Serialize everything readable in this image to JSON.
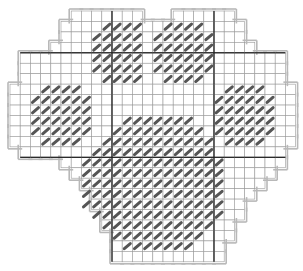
{
  "chart": {
    "type": "cross-stitch-pattern",
    "grid": {
      "cols": 28,
      "rows": 24,
      "origin_x": 10,
      "origin_y": 11,
      "cell_w": 10.2,
      "cell_h": 10.45,
      "major_every": 10,
      "major_cols": [
        10,
        20
      ],
      "major_rows": [
        4,
        14
      ]
    },
    "colors": {
      "fabric": "#ffffff",
      "grid_line": "#9a9a9a",
      "major_line": "#222222",
      "outline": "#b8b8b8",
      "stitch": "#555555"
    },
    "fabric_rows": [
      [
        [
          6,
          13
        ],
        [
          16,
          22
        ]
      ],
      [
        [
          5,
          23
        ]
      ],
      [
        [
          5,
          23
        ]
      ],
      [
        [
          4,
          24
        ]
      ],
      [
        [
          1,
          27
        ]
      ],
      [
        [
          1,
          27
        ]
      ],
      [
        [
          1,
          27
        ]
      ],
      [
        [
          0,
          28
        ]
      ],
      [
        [
          0,
          28
        ]
      ],
      [
        [
          0,
          28
        ]
      ],
      [
        [
          0,
          28
        ]
      ],
      [
        [
          0,
          28
        ]
      ],
      [
        [
          0,
          28
        ]
      ],
      [
        [
          1,
          27
        ]
      ],
      [
        [
          5,
          27
        ]
      ],
      [
        [
          6,
          26
        ]
      ],
      [
        [
          7,
          25
        ]
      ],
      [
        [
          8,
          24
        ]
      ],
      [
        [
          8,
          23
        ]
      ],
      [
        [
          9,
          23
        ]
      ],
      [
        [
          9,
          22
        ]
      ],
      [
        [
          10,
          22
        ]
      ],
      [
        [
          10,
          21
        ]
      ],
      [
        [
          10,
          21
        ]
      ]
    ],
    "stitch_blocks": [
      {
        "name": "toe-top-left",
        "rows": [
          {
            "r": 1,
            "c": [
              9,
              12
            ]
          },
          {
            "r": 2,
            "c": [
              8,
              12
            ]
          },
          {
            "r": 3,
            "c": [
              8,
              12
            ]
          },
          {
            "r": 4,
            "c": [
              8,
              12
            ]
          },
          {
            "r": 5,
            "c": [
              8,
              12
            ]
          },
          {
            "r": 6,
            "c": [
              9,
              12
            ]
          }
        ]
      },
      {
        "name": "toe-top-right",
        "rows": [
          {
            "r": 1,
            "c": [
              15,
              18
            ]
          },
          {
            "r": 2,
            "c": [
              14,
              19
            ]
          },
          {
            "r": 3,
            "c": [
              14,
              19
            ]
          },
          {
            "r": 4,
            "c": [
              14,
              19
            ]
          },
          {
            "r": 5,
            "c": [
              14,
              19
            ]
          },
          {
            "r": 6,
            "c": [
              15,
              18
            ]
          }
        ]
      },
      {
        "name": "toe-left",
        "rows": [
          {
            "r": 7,
            "c": [
              3,
              6
            ]
          },
          {
            "r": 8,
            "c": [
              2,
              7
            ]
          },
          {
            "r": 9,
            "c": [
              2,
              7
            ]
          },
          {
            "r": 10,
            "c": [
              2,
              7
            ]
          },
          {
            "r": 11,
            "c": [
              2,
              7
            ]
          },
          {
            "r": 12,
            "c": [
              3,
              6
            ]
          }
        ]
      },
      {
        "name": "toe-right",
        "rows": [
          {
            "r": 7,
            "c": [
              21,
              24
            ]
          },
          {
            "r": 8,
            "c": [
              20,
              25
            ]
          },
          {
            "r": 9,
            "c": [
              20,
              25
            ]
          },
          {
            "r": 10,
            "c": [
              20,
              25
            ]
          },
          {
            "r": 11,
            "c": [
              20,
              25
            ]
          },
          {
            "r": 12,
            "c": [
              21,
              24
            ]
          }
        ]
      },
      {
        "name": "main-pad",
        "rows": [
          {
            "r": 10,
            "c": [
              11,
              17
            ]
          },
          {
            "r": 11,
            "c": [
              10,
              18
            ]
          },
          {
            "r": 12,
            "c": [
              9,
              19
            ]
          },
          {
            "r": 13,
            "c": [
              8,
              19
            ]
          },
          {
            "r": 14,
            "c": [
              7,
              20
            ]
          },
          {
            "r": 15,
            "c": [
              7,
              20
            ]
          },
          {
            "r": 16,
            "c": [
              7,
              20
            ]
          },
          {
            "r": 17,
            "c": [
              7,
              20
            ]
          },
          {
            "r": 18,
            "c": [
              7,
              20
            ]
          },
          {
            "r": 19,
            "c": [
              8,
              20
            ]
          },
          {
            "r": 20,
            "c": [
              9,
              19
            ]
          },
          {
            "r": 21,
            "c": [
              10,
              18
            ]
          },
          {
            "r": 22,
            "c": [
              11,
              17
            ]
          }
        ]
      }
    ]
  }
}
